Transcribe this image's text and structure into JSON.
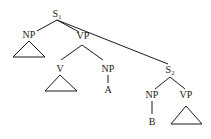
{
  "diagram": {
    "type": "syntax-tree",
    "nodes": {
      "s1": {
        "label": "S",
        "subscript": "1"
      },
      "np1": {
        "label": "NP"
      },
      "vp1": {
        "label": "VP"
      },
      "v": {
        "label": "V"
      },
      "np2": {
        "label": "NP"
      },
      "a": {
        "label": "A"
      },
      "s2": {
        "label": "S",
        "subscript": "2"
      },
      "np3": {
        "label": "NP"
      },
      "b": {
        "label": "B"
      },
      "vp2": {
        "label": "VP"
      }
    },
    "edges": [
      [
        "s1",
        "np1"
      ],
      [
        "s1",
        "vp1"
      ],
      [
        "s1",
        "s2"
      ],
      [
        "vp1",
        "v"
      ],
      [
        "vp1",
        "np2"
      ],
      [
        "np2",
        "a"
      ],
      [
        "s2",
        "np3"
      ],
      [
        "s2",
        "vp2"
      ],
      [
        "np3",
        "b"
      ]
    ],
    "triangles": [
      "np1",
      "v",
      "vp2"
    ]
  }
}
